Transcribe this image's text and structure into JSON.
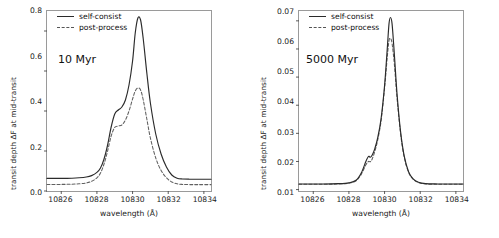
{
  "figure": {
    "panels": [
      {
        "id": "left",
        "annotation": "10 Myr",
        "legend": [
          {
            "label": "self-consist",
            "style": "solid"
          },
          {
            "label": "post-process",
            "style": "dashed"
          }
        ],
        "xlabel": "wavelength (Å)",
        "ylabel": "transit depth ΔF at mid-transit",
        "xticks": [
          "10826",
          "10828",
          "10830",
          "10832",
          "10834"
        ],
        "yticks": [
          "0.0",
          "0.2",
          "0.4",
          "0.6",
          "0.8"
        ]
      },
      {
        "id": "right",
        "annotation": "5000 Myr",
        "legend": [
          {
            "label": "self-consist",
            "style": "solid"
          },
          {
            "label": "post-process",
            "style": "dashed"
          }
        ],
        "xlabel": "wavelength (Å)",
        "ylabel": "transit depth ΔF at mid-transit",
        "xticks": [
          "10826",
          "10828",
          "10830",
          "10832",
          "10834"
        ],
        "yticks": [
          "0.01",
          "0.02",
          "0.03",
          "0.04",
          "0.05",
          "0.06",
          "0.07"
        ]
      }
    ]
  },
  "chart_data": [
    {
      "type": "line",
      "title": "10 Myr",
      "xlabel": "wavelength (Å)",
      "ylabel": "transit depth ΔF at mid-transit",
      "xlim": [
        10825.2,
        10834.4
      ],
      "ylim": [
        0.0,
        0.9
      ],
      "xticks": [
        10826,
        10828,
        10830,
        10832,
        10834
      ],
      "yticks": [
        0.0,
        0.2,
        0.4,
        0.6,
        0.8
      ],
      "grid": false,
      "legend_position": "upper-left",
      "series": [
        {
          "name": "self-consist",
          "style": "solid",
          "color": "#2b2b2b",
          "x": [
            10825.2,
            10826.0,
            10826.6,
            10827.0,
            10827.4,
            10827.7,
            10828.0,
            10828.2,
            10828.4,
            10828.6,
            10828.8,
            10829.0,
            10829.2,
            10829.4,
            10829.6,
            10829.8,
            10830.0,
            10830.15,
            10830.3,
            10830.45,
            10830.6,
            10830.8,
            10831.0,
            10831.3,
            10831.6,
            10831.9,
            10832.2,
            10832.5,
            10832.8,
            10833.2,
            10833.7,
            10834.4
          ],
          "y": [
            0.063,
            0.063,
            0.064,
            0.066,
            0.07,
            0.077,
            0.093,
            0.115,
            0.16,
            0.23,
            0.32,
            0.385,
            0.405,
            0.42,
            0.455,
            0.53,
            0.65,
            0.79,
            0.865,
            0.855,
            0.76,
            0.59,
            0.44,
            0.285,
            0.185,
            0.12,
            0.08,
            0.064,
            0.06,
            0.059,
            0.059,
            0.059
          ]
        },
        {
          "name": "post-process",
          "style": "dashed",
          "color": "#606060",
          "x": [
            10825.2,
            10826.0,
            10826.6,
            10827.0,
            10827.4,
            10827.7,
            10828.0,
            10828.2,
            10828.4,
            10828.6,
            10828.8,
            10829.0,
            10829.2,
            10829.4,
            10829.6,
            10829.8,
            10830.0,
            10830.15,
            10830.3,
            10830.45,
            10830.6,
            10830.8,
            10831.0,
            10831.3,
            10831.6,
            10831.9,
            10832.2,
            10832.5,
            10832.8,
            10833.2,
            10833.7,
            10834.4
          ],
          "y": [
            0.033,
            0.033,
            0.034,
            0.036,
            0.04,
            0.048,
            0.066,
            0.09,
            0.135,
            0.2,
            0.275,
            0.318,
            0.325,
            0.33,
            0.355,
            0.4,
            0.46,
            0.5,
            0.515,
            0.505,
            0.455,
            0.36,
            0.265,
            0.165,
            0.103,
            0.066,
            0.045,
            0.036,
            0.033,
            0.032,
            0.032,
            0.032
          ]
        }
      ]
    },
    {
      "type": "line",
      "title": "5000 Myr",
      "xlabel": "wavelength (Å)",
      "ylabel": "transit depth ΔF at mid-transit",
      "xlim": [
        10825.2,
        10834.4
      ],
      "ylim": [
        0.0095,
        0.0735
      ],
      "xticks": [
        10826,
        10828,
        10830,
        10832,
        10834
      ],
      "yticks": [
        0.01,
        0.02,
        0.03,
        0.04,
        0.05,
        0.06,
        0.07
      ],
      "grid": false,
      "legend_position": "upper-left",
      "series": [
        {
          "name": "self-consist",
          "style": "solid",
          "color": "#2b2b2b",
          "x": [
            10825.2,
            10826.5,
            10827.4,
            10828.0,
            10828.4,
            10828.7,
            10828.95,
            10829.1,
            10829.2,
            10829.3,
            10829.45,
            10829.6,
            10829.8,
            10830.0,
            10830.15,
            10830.25,
            10830.33,
            10830.42,
            10830.55,
            10830.7,
            10830.9,
            10831.1,
            10831.35,
            10831.6,
            10831.9,
            10832.3,
            10833.0,
            10834.4
          ],
          "y": [
            0.012,
            0.012,
            0.0121,
            0.0124,
            0.0133,
            0.016,
            0.02,
            0.0218,
            0.0215,
            0.0222,
            0.0245,
            0.028,
            0.035,
            0.047,
            0.06,
            0.069,
            0.0712,
            0.069,
            0.058,
            0.044,
            0.0305,
            0.022,
            0.0163,
            0.0138,
            0.0126,
            0.0121,
            0.012,
            0.012
          ]
        },
        {
          "name": "post-process",
          "style": "dashed",
          "color": "#606060",
          "x": [
            10825.2,
            10826.5,
            10827.4,
            10828.0,
            10828.4,
            10828.7,
            10828.95,
            10829.1,
            10829.2,
            10829.3,
            10829.45,
            10829.6,
            10829.8,
            10830.0,
            10830.15,
            10830.25,
            10830.33,
            10830.42,
            10830.55,
            10830.7,
            10830.9,
            10831.1,
            10831.35,
            10831.6,
            10831.9,
            10832.3,
            10833.0,
            10834.4
          ],
          "y": [
            0.0119,
            0.0119,
            0.012,
            0.0123,
            0.0131,
            0.0155,
            0.0188,
            0.02,
            0.0199,
            0.0208,
            0.0235,
            0.0272,
            0.0342,
            0.046,
            0.057,
            0.063,
            0.0637,
            0.062,
            0.0545,
            0.0425,
            0.0298,
            0.0216,
            0.0161,
            0.0137,
            0.0125,
            0.012,
            0.0119,
            0.0119
          ]
        }
      ]
    }
  ]
}
